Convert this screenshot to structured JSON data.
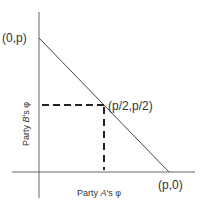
{
  "diagram": {
    "type": "bargaining-frontier",
    "colors": {
      "axis": "#555555",
      "frontier": "#444444",
      "dashed": "#222222",
      "text": "#333333"
    },
    "points": {
      "top": "(0,p)",
      "midpoint": "(p/2,p/2)",
      "right": "(p,0)"
    },
    "axes": {
      "x_label_prefix": "Party ",
      "x_label_party": "A",
      "x_label_suffix": "'s φ",
      "y_label_prefix": "Party ",
      "y_label_party": "B",
      "y_label_suffix": "'s φ"
    }
  }
}
